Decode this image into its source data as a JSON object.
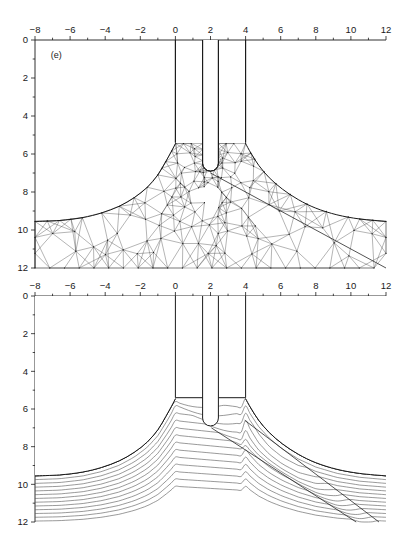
{
  "figure": {
    "background_color": "#ffffff",
    "line_color": "#1a1a1a",
    "mesh_color": "#303030",
    "stream_color": "#555555"
  },
  "chart_data": {
    "type": "line",
    "title": "",
    "subtitle": "",
    "panels": [
      {
        "tag": "(e)",
        "content_type": "finite-element-mesh",
        "description": "Triangular finite element mesh of an extrusion/indentation domain with a U-shaped punch entering between two vertical die walls at x=0 and x=4.",
        "xlabel": "",
        "ylabel": "",
        "xlim": [
          -8,
          12
        ],
        "ylim": [
          12,
          0
        ],
        "y_axis_inverted": true,
        "xticks": [
          -8,
          -6,
          -4,
          -2,
          0,
          2,
          4,
          6,
          8,
          10,
          12
        ],
        "xticklabels": [
          "−8",
          "−6",
          "−4",
          "−2",
          "0",
          "2",
          "4",
          "6",
          "8",
          "10",
          "12"
        ],
        "xminortick_step": 1,
        "yticks": [
          0,
          2,
          4,
          6,
          8,
          10,
          12
        ],
        "yticklabels": [
          "0",
          "2",
          "4",
          "6",
          "8",
          "10",
          "12"
        ],
        "yminortick_step": 1,
        "grid": false,
        "legend": false,
        "die_walls_x": [
          0,
          4
        ],
        "die_wall_top_y": 0,
        "die_wall_bottom_y": 5.4,
        "punch_left_x": 1.55,
        "punch_right_x": 2.45,
        "punch_tip_y": 6.9,
        "free_surface_left": [
          [
            -8,
            9.55
          ],
          [
            -6.6,
            9.5
          ],
          [
            -5.3,
            9.35
          ],
          [
            -4.2,
            9.1
          ],
          [
            -3.2,
            8.75
          ],
          [
            -2.35,
            8.3
          ],
          [
            -1.6,
            7.75
          ],
          [
            -1.0,
            7.1
          ],
          [
            -0.55,
            6.4
          ],
          [
            -0.22,
            5.85
          ],
          [
            0.0,
            5.45
          ]
        ],
        "free_surface_right": [
          [
            4.0,
            5.45
          ],
          [
            4.3,
            5.95
          ],
          [
            4.75,
            6.6
          ],
          [
            5.35,
            7.25
          ],
          [
            6.1,
            7.85
          ],
          [
            7.0,
            8.4
          ],
          [
            8.0,
            8.85
          ],
          [
            9.2,
            9.2
          ],
          [
            10.5,
            9.42
          ],
          [
            12,
            9.55
          ]
        ],
        "shear_line": [
          [
            2.0,
            7.0
          ],
          [
            12,
            12
          ]
        ]
      },
      {
        "tag": "(f)",
        "content_type": "streamlines-shear-band",
        "description": "Material flow streamlines beneath the punch with a straight shear band running from the punch tip down to the lower right.",
        "xlabel": "",
        "ylabel": "",
        "xlim": [
          -8,
          12
        ],
        "ylim": [
          12,
          0
        ],
        "y_axis_inverted": true,
        "xticks": [
          -8,
          -6,
          -4,
          -2,
          0,
          2,
          4,
          6,
          8,
          10,
          12
        ],
        "xticklabels": [
          "−8",
          "−6",
          "−4",
          "−2",
          "0",
          "2",
          "4",
          "6",
          "8",
          "10",
          "12"
        ],
        "xminortick_step": 1,
        "yticks": [
          0,
          2,
          4,
          6,
          8,
          10,
          12
        ],
        "yticklabels": [
          "0",
          "2",
          "4",
          "6",
          "8",
          "10",
          "12"
        ],
        "yminortick_step": 1,
        "grid": false,
        "legend": false,
        "die_walls_x": [
          0,
          4
        ],
        "die_wall_top_y": 0,
        "die_wall_bottom_y": 5.4,
        "punch_left_x": 1.55,
        "punch_right_x": 2.45,
        "punch_tip_y": 6.9,
        "streamline_count_left": 13,
        "streamline_inlet_depths": [
          9.55,
          9.75,
          9.95,
          10.15,
          10.35,
          10.55,
          10.75,
          10.95,
          11.15,
          11.35,
          11.55,
          11.75,
          11.95
        ],
        "shear_band_upper": [
          [
            2.05,
            7.0
          ],
          [
            10.3,
            12.0
          ]
        ],
        "shear_band_lower": [
          [
            3.95,
            6.6
          ],
          [
            11.6,
            12.0
          ]
        ]
      }
    ]
  }
}
